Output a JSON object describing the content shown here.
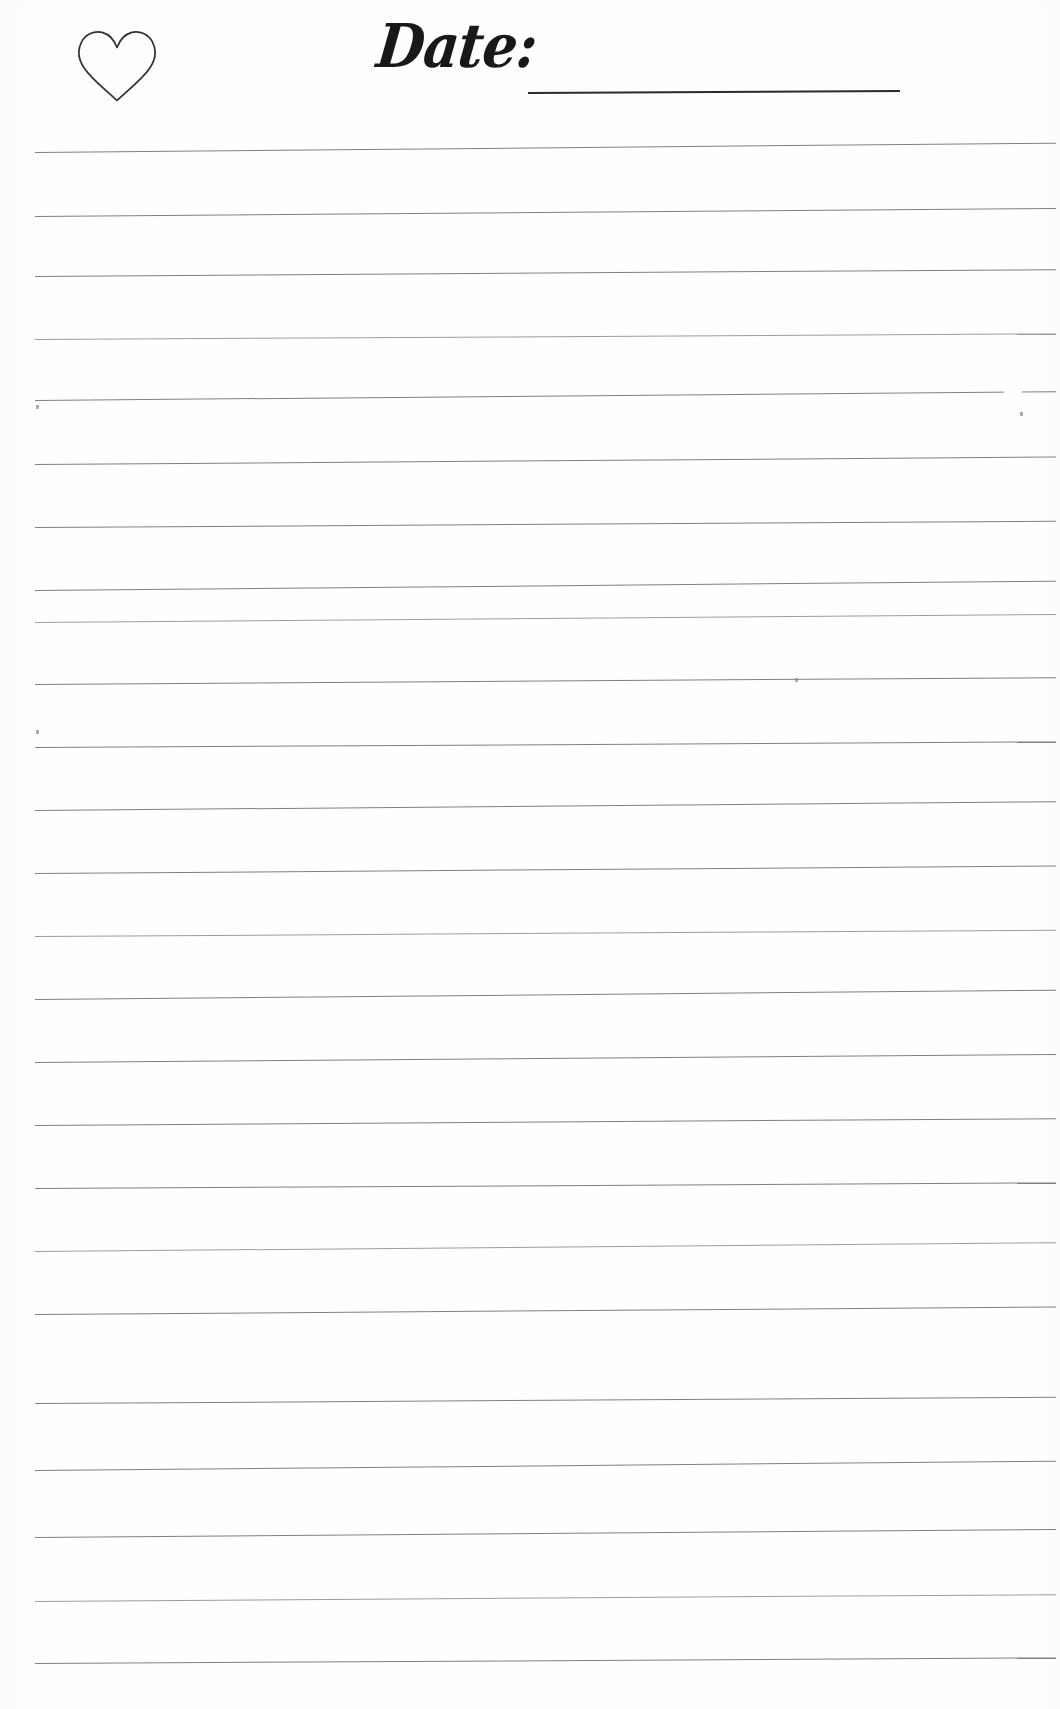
{
  "page": {
    "kind": "lined-journal-page",
    "width": 1060,
    "height": 1709,
    "background_color": "#fefefe",
    "rule_color": "#7d7f85",
    "ink_color": "#18181a",
    "date_underline_color": "#2b2b2e"
  },
  "header": {
    "heart_icon_name": "heart-outline-icon",
    "date_label": "Date:",
    "date_value": "",
    "date_field_placeholder": ""
  },
  "body": {
    "line_count": 24,
    "first_line_y": 152,
    "line_spacing": 63.2,
    "line_start_x": 35,
    "line_end_x": 1056,
    "skew_degrees": -0.42,
    "lines": [
      {
        "index": 1,
        "y": 152,
        "text": ""
      },
      {
        "index": 2,
        "y": 216,
        "text": ""
      },
      {
        "index": 3,
        "y": 276,
        "text": ""
      },
      {
        "index": 4,
        "y": 339,
        "text": ""
      },
      {
        "index": 5,
        "y": 400,
        "text": ""
      },
      {
        "index": 6,
        "y": 464,
        "text": ""
      },
      {
        "index": 7,
        "y": 527,
        "text": ""
      },
      {
        "index": 8,
        "y": 590,
        "text": ""
      },
      {
        "index": 9,
        "y": 622,
        "text": ""
      },
      {
        "index": 10,
        "y": 684,
        "text": ""
      },
      {
        "index": 11,
        "y": 747,
        "text": ""
      },
      {
        "index": 12,
        "y": 810,
        "text": ""
      },
      {
        "index": 13,
        "y": 873,
        "text": ""
      },
      {
        "index": 14,
        "y": 936,
        "text": ""
      },
      {
        "index": 15,
        "y": 999,
        "text": ""
      },
      {
        "index": 16,
        "y": 1062,
        "text": ""
      },
      {
        "index": 17,
        "y": 1125,
        "text": ""
      },
      {
        "index": 18,
        "y": 1188,
        "text": ""
      },
      {
        "index": 19,
        "y": 1251,
        "text": ""
      },
      {
        "index": 20,
        "y": 1314,
        "text": ""
      },
      {
        "index": 21,
        "y": 1403,
        "text": ""
      },
      {
        "index": 22,
        "y": 1470,
        "text": ""
      },
      {
        "index": 23,
        "y": 1537,
        "text": ""
      },
      {
        "index": 24,
        "y": 1601,
        "text": ""
      },
      {
        "index": 25,
        "y": 1663,
        "text": ""
      }
    ]
  }
}
